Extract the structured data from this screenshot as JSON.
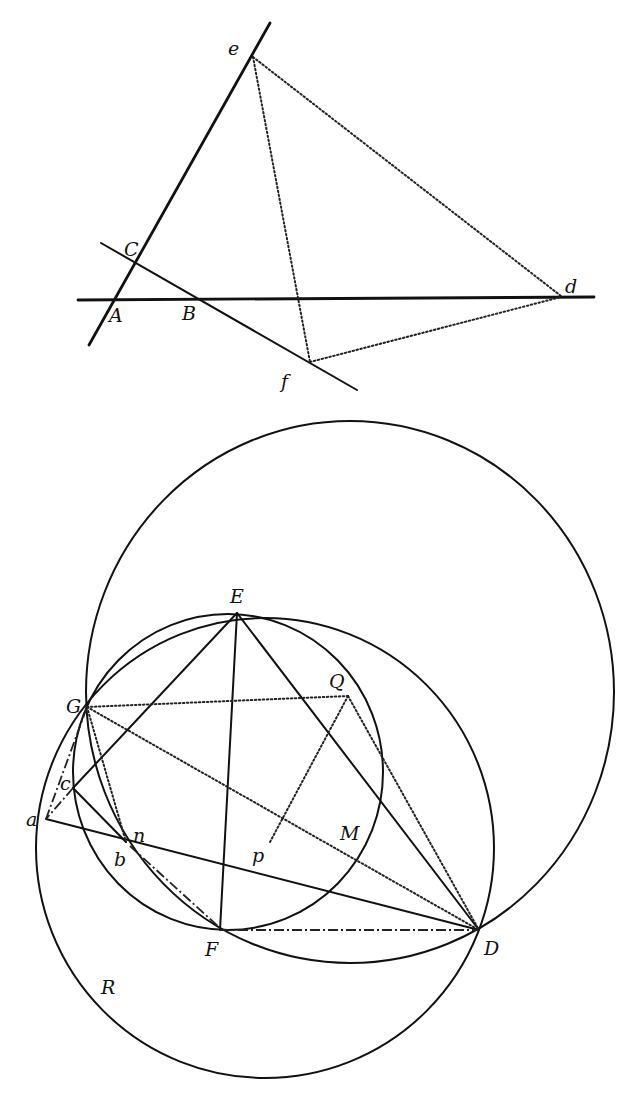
{
  "figure_top": {
    "labels": {
      "A": "A",
      "B": "B",
      "C": "C",
      "d": "d",
      "e": "e",
      "f": "f"
    }
  },
  "figure_bottom": {
    "labels": {
      "E": "E",
      "G": "G",
      "Q": "Q",
      "c": "c",
      "a": "a",
      "n": "n",
      "b": "b",
      "p": "p",
      "M": "M",
      "F": "F",
      "D": "D",
      "R": "R"
    }
  },
  "colors": {
    "ink": "#111111",
    "paper": "#ffffff"
  }
}
